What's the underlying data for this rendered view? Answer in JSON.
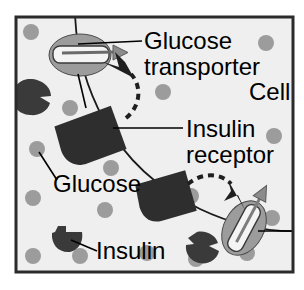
{
  "figure": {
    "background_color": "#ffffff",
    "cell_fill": "#efefef",
    "border_color": "#2b2b2b",
    "glucose_color": "#9c9c9c",
    "insulin_color": "#3a3a3a",
    "receptor_color": "#2e2e2e",
    "transporter_fill": "#9c9c9c",
    "channel_color": "#f2f2f2",
    "membrane_color": "#1a1a1a",
    "text_color": "#000000"
  },
  "labels": {
    "glucose_transporter_line1": "Glucose",
    "glucose_transporter_line2": "transporter",
    "cell": "Cell",
    "insulin_receptor_line1": "Insulin",
    "insulin_receptor_line2": "receptor",
    "glucose": "Glucose",
    "insulin": "Insulin"
  },
  "icons": {
    "glucose_transporter_top": "glucose-transporter-icon",
    "glucose_transporter_bottom": "glucose-transporter-icon",
    "insulin_receptor_upper": "insulin-receptor-icon",
    "insulin_receptor_lower": "insulin-receptor-icon",
    "insulin_molecule": "insulin-molecule-icon",
    "glucose_molecule": "glucose-molecule-icon",
    "membrane": "cell-membrane-line",
    "signal_arrow": "dashed-signal-arrow-icon",
    "transport_arrow": "glucose-transport-arrow-icon"
  },
  "diagram_data": {
    "type": "biology-schematic",
    "glucose_dots": [
      {
        "cx": 31,
        "cy": 32,
        "r": 8
      },
      {
        "cx": 266,
        "cy": 43,
        "r": 8
      },
      {
        "cx": 163,
        "cy": 92,
        "r": 8
      },
      {
        "cx": 70,
        "cy": 108,
        "r": 8
      },
      {
        "cx": 274,
        "cy": 136,
        "r": 8
      },
      {
        "cx": 37,
        "cy": 149,
        "r": 8
      },
      {
        "cx": 111,
        "cy": 168,
        "r": 8
      },
      {
        "cx": 33,
        "cy": 198,
        "r": 8
      },
      {
        "cx": 105,
        "cy": 210,
        "r": 8
      },
      {
        "cx": 191,
        "cy": 196,
        "r": 8
      },
      {
        "cx": 33,
        "cy": 256,
        "r": 8
      },
      {
        "cx": 80,
        "cy": 256,
        "r": 8
      },
      {
        "cx": 147,
        "cy": 253,
        "r": 8
      },
      {
        "cx": 196,
        "cy": 259,
        "r": 8
      },
      {
        "cx": 247,
        "cy": 253,
        "r": 8
      },
      {
        "cx": 272,
        "cy": 218,
        "r": 8
      }
    ],
    "insulin_molecules": [
      {
        "x": 30,
        "y": 96
      },
      {
        "x": 63,
        "y": 235
      },
      {
        "x": 207,
        "y": 245
      }
    ],
    "transporters": [
      {
        "x": 80,
        "y": 55,
        "angle": 0
      },
      {
        "x": 244,
        "y": 228,
        "angle": -62
      }
    ],
    "receptors": [
      {
        "x": 98,
        "y": 135,
        "angle": -22
      },
      {
        "x": 172,
        "y": 197,
        "angle": -18
      }
    ]
  }
}
